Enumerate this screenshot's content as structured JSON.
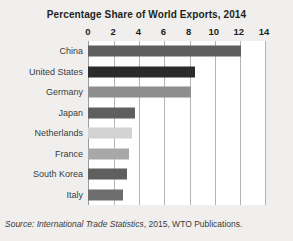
{
  "chart_data": {
    "type": "bar",
    "orientation": "horizontal",
    "title": "Percentage Share of World Exports, 2014",
    "xlabel": "",
    "ylabel": "",
    "xlim": [
      0,
      14
    ],
    "xticks": [
      0,
      2,
      4,
      6,
      8,
      10,
      12,
      14
    ],
    "grid": true,
    "legend": false,
    "categories": [
      "China",
      "United States",
      "Germany",
      "Japan",
      "Netherlands",
      "France",
      "South Korea",
      "Italy"
    ],
    "values": [
      12.2,
      8.5,
      8.2,
      3.7,
      3.5,
      3.3,
      3.1,
      2.8
    ],
    "bar_colors": [
      "#5f5f5f",
      "#2b2b2b",
      "#8e8e8e",
      "#5f5f5f",
      "#d2d2d2",
      "#a8a8a8",
      "#5f5f5f",
      "#6e6e6e"
    ],
    "annotations": {
      "source_prefix": "Source: ",
      "source_italic": "International Trade Statistics",
      "source_suffix": ", 2015, WTO Publications."
    }
  },
  "colors": {
    "figure_background": "#f0efed",
    "plot_background": "#ffffff",
    "gridline": "#b5b5b5",
    "axis": "#9b9b9b",
    "title_text": "#231f20",
    "label_text": "#3b3b3b"
  },
  "source_note_full": "Source: International Trade Statistics, 2015, WTO Publications."
}
